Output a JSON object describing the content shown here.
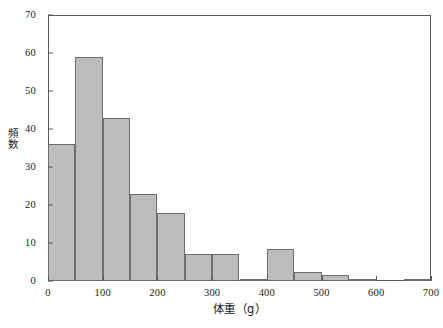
{
  "chart_data": {
    "type": "bar",
    "title": "",
    "subtitle": "",
    "xlabel": "体重（g）",
    "ylabel": "頻数",
    "xlim": [
      0,
      700
    ],
    "ylim": [
      0,
      70
    ],
    "grid": false,
    "legend": false,
    "bin_width": 50,
    "bin_edges": [
      0,
      50,
      100,
      150,
      200,
      250,
      300,
      350,
      400,
      450,
      500,
      550,
      600,
      650,
      700
    ],
    "categories": [
      "0-50",
      "50-100",
      "100-150",
      "150-200",
      "200-250",
      "250-300",
      "300-350",
      "350-400",
      "400-450",
      "450-500",
      "500-550",
      "550-600",
      "600-650",
      "650-700"
    ],
    "values": [
      36,
      59,
      43,
      23,
      18,
      7,
      7,
      0.5,
      8.5,
      2.5,
      1.5,
      0.3,
      0,
      0.3
    ],
    "xticks": [
      0,
      100,
      200,
      300,
      400,
      500,
      600,
      700
    ],
    "xtick_labels": [
      "0",
      "100",
      "200",
      "300",
      "400",
      "500",
      "600",
      "700"
    ],
    "yticks": [
      0,
      10,
      20,
      30,
      40,
      50,
      60,
      70
    ],
    "ytick_labels": [
      "0",
      "10",
      "20",
      "30",
      "40",
      "50",
      "60",
      "70"
    ],
    "bar_fill_color": "#bdbdbd",
    "bar_edge_color": "#6d6d70",
    "axis_color": "#59595c",
    "background_color": "#ffffff"
  }
}
